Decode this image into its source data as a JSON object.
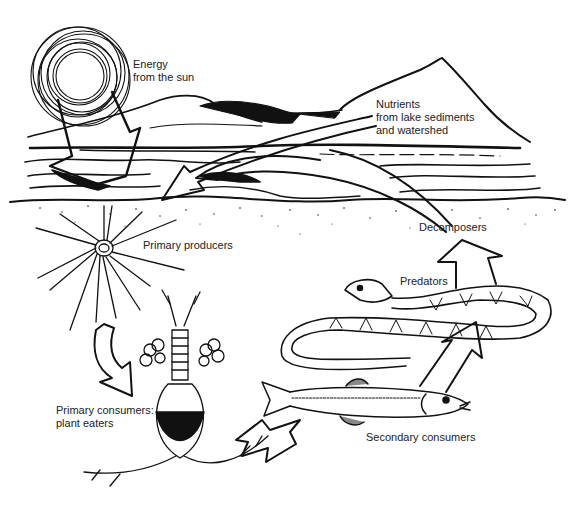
{
  "diagram": {
    "type": "food-web / nutrient cycle illustration",
    "style": {
      "ink": "#111111",
      "background": "#ffffff",
      "text": "#222222"
    },
    "labels": {
      "energy": {
        "line1": "Energy",
        "line2": "from the sun"
      },
      "nutrients": {
        "line1": "Nutrients",
        "line2": "from lake sediments",
        "line3": "and watershed"
      },
      "producers": {
        "line1": "Primary producers"
      },
      "decomposers": {
        "line1": "Decomposers"
      },
      "predators": {
        "line1": "Predators"
      },
      "primary_consumers": {
        "line1": "Primary consumers:",
        "line2": "plant eaters"
      },
      "secondary_consumers": {
        "line1": "Secondary consumers"
      }
    },
    "elements": [
      {
        "name": "sun",
        "icon": "sun-icon"
      },
      {
        "name": "mountains",
        "icon": "mountain-icon"
      },
      {
        "name": "lake-water",
        "icon": "water-waves-icon"
      },
      {
        "name": "sediment",
        "icon": "sediment-icon"
      },
      {
        "name": "phytoplankton",
        "icon": "diatom-icon"
      },
      {
        "name": "zooplankton",
        "icon": "copepod-icon"
      },
      {
        "name": "fish",
        "icon": "fish-icon"
      },
      {
        "name": "snake",
        "icon": "snake-icon"
      }
    ],
    "flows": [
      {
        "from": "Energy from the sun",
        "to": "Lake water"
      },
      {
        "from": "Nutrients from lake sediments and watershed",
        "to": "Lake water"
      },
      {
        "from": "Decomposers",
        "to": "Lake water"
      },
      {
        "from": "Primary producers",
        "to": "Primary consumers: plant eaters"
      },
      {
        "from": "Primary consumers: plant eaters",
        "to": "Secondary consumers"
      },
      {
        "from": "Secondary consumers",
        "to": "Predators"
      },
      {
        "from": "Predators",
        "to": "Decomposers"
      }
    ]
  }
}
